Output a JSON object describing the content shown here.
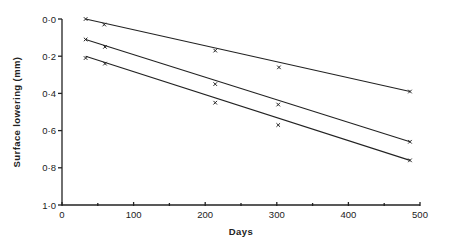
{
  "chart_data": {
    "type": "scatter",
    "title": "",
    "xlabel": "Days",
    "ylabel": "Surface lowering (mm)",
    "xlim": [
      0,
      500
    ],
    "ylim": [
      0.0,
      1.0
    ],
    "y_inverted": true,
    "grid": false,
    "legend": null,
    "x_ticks": [
      0,
      100,
      200,
      300,
      400,
      500
    ],
    "x_tick_labels": [
      "0",
      "100",
      "200",
      "300",
      "400",
      "500"
    ],
    "x_minor_ticks": [
      50,
      150,
      250,
      350,
      450
    ],
    "y_ticks": [
      0.0,
      0.2,
      0.4,
      0.6,
      0.8,
      1.0
    ],
    "y_tick_labels": [
      "0·0",
      "0·2",
      "0·4",
      "0·6",
      "0·8",
      "1·0"
    ],
    "marker": "x",
    "fit": "linear",
    "series": [
      {
        "name": "Series 1",
        "x": [
          33,
          59,
          214,
          303,
          486
        ],
        "y": [
          0.0,
          0.03,
          0.17,
          0.26,
          0.39
        ],
        "fit_line": {
          "x": [
            33,
            486
          ],
          "y": [
            0.0,
            0.39
          ]
        }
      },
      {
        "name": "Series 2",
        "x": [
          33,
          60,
          214,
          302,
          486
        ],
        "y": [
          0.11,
          0.15,
          0.35,
          0.46,
          0.66
        ],
        "fit_line": {
          "x": [
            33,
            486
          ],
          "y": [
            0.11,
            0.66
          ]
        }
      },
      {
        "name": "Series 3",
        "x": [
          33,
          60,
          214,
          302,
          486
        ],
        "y": [
          0.21,
          0.24,
          0.45,
          0.57,
          0.76
        ],
        "fit_line": {
          "x": [
            33,
            486
          ],
          "y": [
            0.2,
            0.76
          ]
        }
      }
    ]
  }
}
